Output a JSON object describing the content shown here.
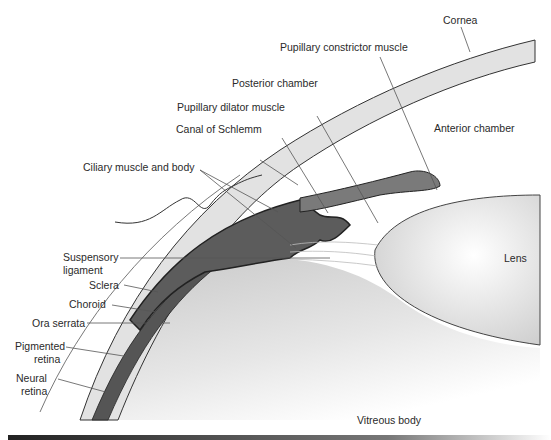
{
  "diagram": {
    "colors": {
      "cornea_sclera_fill": "#e2e2e2",
      "iris_ciliary_fill": "#7a7a7a",
      "ciliary_muscle_fill": "#5c5c5c",
      "lens_fill": "#d8d8d8",
      "vitreous_fill": "#cfcfcf",
      "outline": "#222222",
      "label_text": "#2a2a2a",
      "footer_bar": "#333333"
    },
    "labels": {
      "cornea": "Cornea",
      "pupillary_constrictor": "Pupillary constrictor muscle",
      "posterior_chamber": "Posterior chamber",
      "pupillary_dilator": "Pupillary dilator muscle",
      "canal_of_schlemm": "Canal of Schlemm",
      "anterior_chamber": "Anterior chamber",
      "ciliary_muscle_body": "Ciliary muscle and body",
      "suspensory_1": "Suspensory",
      "suspensory_2": "ligament",
      "lens": "Lens",
      "sclera": "Sclera",
      "choroid": "Choroid",
      "ora_serrata": "Ora serrata",
      "pigmented_1": "Pigmented",
      "pigmented_2": "retina",
      "neural_1": "Neural",
      "neural_2": "retina",
      "vitreous_body": "Vitreous body"
    }
  }
}
